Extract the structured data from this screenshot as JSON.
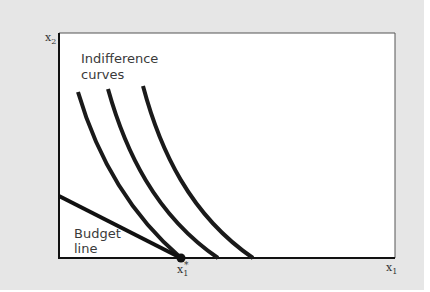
{
  "diagram": {
    "type": "indifference-curves-corner-solution",
    "axes": {
      "x_label": "x",
      "x_label_sub": "1",
      "y_label": "x",
      "y_label_sub": "2"
    },
    "annotations": {
      "indifference_line1": "Indifference",
      "indifference_line2": "curves",
      "budget_line1": "Budget",
      "budget_line2": "line",
      "optimum_label": "x",
      "optimum_sub": "1",
      "optimum_sup": "*"
    },
    "indifference_curve_count": 3,
    "colors": {
      "background": "#e6e6e6",
      "plot_area": "#ffffff",
      "curve": "#1a1a1a",
      "frame": "#222222"
    }
  }
}
